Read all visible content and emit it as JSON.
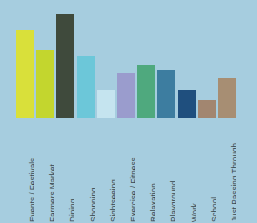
{
  "chart_data": {
    "type": "bar",
    "title": "",
    "subtitle": "",
    "xlabel": "",
    "ylabel": "",
    "grid": false,
    "legend": "none",
    "ylim": [
      0,
      104
    ],
    "background_color": "#a6cddf",
    "label_color": "#38474f",
    "categories": [
      "Events / Festivals",
      "Farmers Market",
      "Dining",
      "Shopping",
      "Sightseeing",
      "Exercise / Fitness",
      "Relaxation",
      "Playground",
      "Work",
      "School",
      "Just Passing Through"
    ],
    "values": [
      88,
      68,
      104,
      62,
      28,
      45,
      53,
      48,
      28,
      18,
      40
    ],
    "colors": [
      "#d9e03a",
      "#c3d62e",
      "#3f4a3c",
      "#6cc7d9",
      "#c5e4ef",
      "#9a9ccd",
      "#4fa97e",
      "#3d7da0",
      "#1f4f7e",
      "#a28670",
      "#a78e73"
    ]
  }
}
